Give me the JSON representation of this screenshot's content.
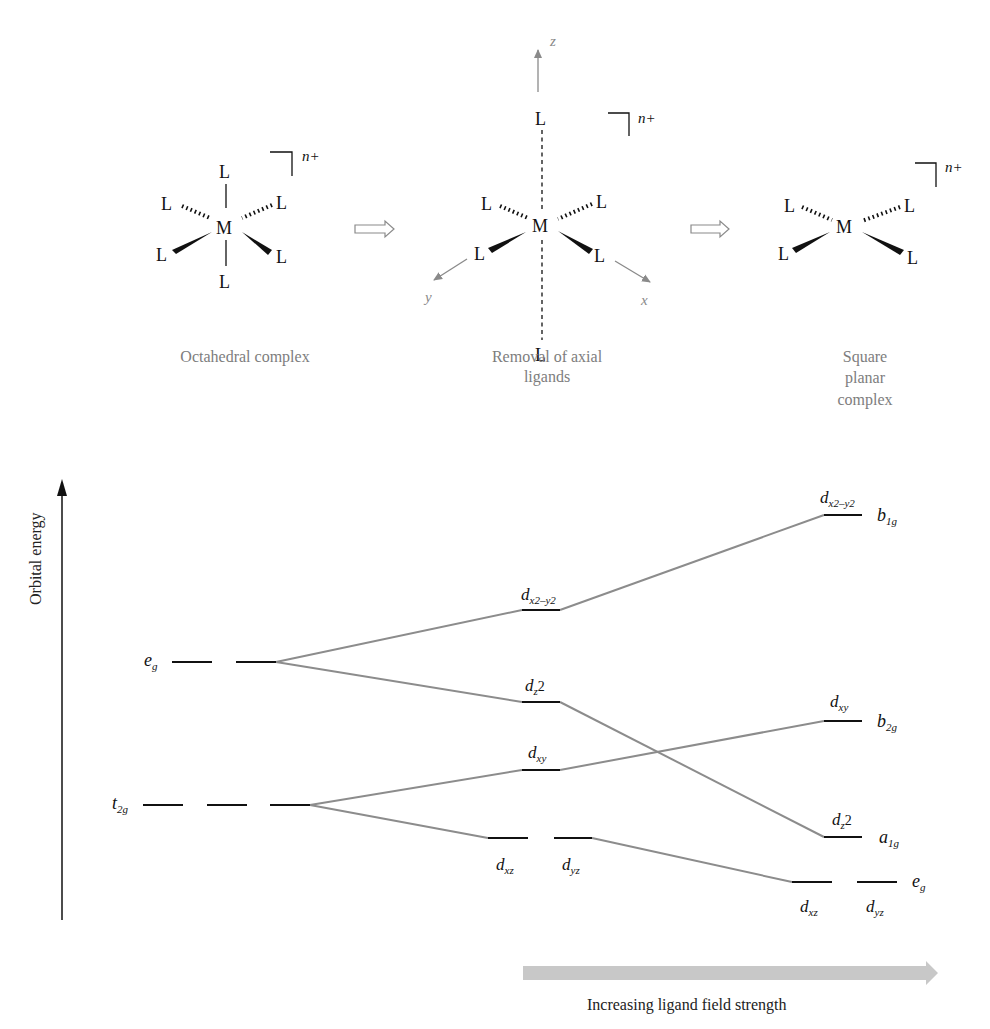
{
  "structures": {
    "octahedral": {
      "metal": "M",
      "ligand": "L",
      "charge": "n+",
      "caption": "Octahedral complex"
    },
    "axial_removal": {
      "metal": "M",
      "ligand": "L",
      "charge": "n+",
      "axes": {
        "z": "z",
        "y": "y",
        "x": "x"
      },
      "caption_line1": "Removal of axial",
      "caption_line2": "ligands"
    },
    "square_planar": {
      "metal": "M",
      "ligand": "L",
      "charge": "n+",
      "caption_line1": "Square",
      "caption_line2": "planar",
      "caption_line3": "complex"
    },
    "arrow_icons": [
      "hollow-right-arrow",
      "hollow-right-arrow"
    ]
  },
  "energy_diagram": {
    "y_axis_label": "Orbital energy",
    "x_axis_label": "Increasing ligand field strength",
    "colors": {
      "levels": "#111111",
      "correlation_lines": "#8c8c8c",
      "field_arrow": "#c8c8c8"
    },
    "octahedral": {
      "eg": {
        "main": "e",
        "sub": "g"
      },
      "t2g": {
        "main": "t",
        "sub": "2g"
      }
    },
    "intermediate": {
      "dx2y2": {
        "main": "d",
        "sub": "x2–y2"
      },
      "dz2": {
        "main": "d",
        "sub": "z",
        "tail": "2"
      },
      "dxy": {
        "main": "d",
        "sub": "xy"
      },
      "dxz": {
        "main": "d",
        "sub": "xz"
      },
      "dyz": {
        "main": "d",
        "sub": "yz"
      }
    },
    "square_planar": {
      "dx2y2": {
        "main": "d",
        "sub": "x2–y2",
        "symmetry": "b",
        "symmetry_sub": "1g"
      },
      "dxy": {
        "main": "d",
        "sub": "xy",
        "symmetry": "b",
        "symmetry_sub": "2g"
      },
      "dz2": {
        "main": "d",
        "sub": "z",
        "tail": "2",
        "symmetry": "a",
        "symmetry_sub": "1g"
      },
      "dxz": {
        "main": "d",
        "sub": "xz"
      },
      "dyz": {
        "main": "d",
        "sub": "yz"
      },
      "eg": {
        "symmetry": "e",
        "symmetry_sub": "g"
      }
    }
  }
}
